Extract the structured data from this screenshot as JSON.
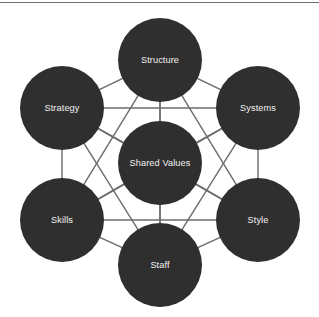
{
  "diagram": {
    "type": "network-graph",
    "canvas": {
      "width": 319,
      "height": 317,
      "background": "#ffffff"
    },
    "top_rule": {
      "visible": true,
      "color": "#6e6e6e",
      "y": 2,
      "thickness": 1
    },
    "style": {
      "node_fill": "#2f2f2f",
      "node_label_color": "#f2f2f2",
      "edge_color": "#6b6b6b",
      "edge_width": 1.4,
      "node_radius": 42,
      "center_node_radius": 42,
      "label_font_size": 9.2
    },
    "nodes": [
      {
        "id": "structure",
        "label": "Structure",
        "cx": 160,
        "cy": 60,
        "r": 42,
        "role": "hard-element"
      },
      {
        "id": "systems",
        "label": "Systems",
        "cx": 258,
        "cy": 108,
        "r": 42,
        "role": "hard-element"
      },
      {
        "id": "style",
        "label": "Style",
        "cx": 258,
        "cy": 220,
        "r": 42,
        "role": "soft-element"
      },
      {
        "id": "staff",
        "label": "Staff",
        "cx": 160,
        "cy": 265,
        "r": 42,
        "role": "soft-element"
      },
      {
        "id": "skills",
        "label": "Skills",
        "cx": 62,
        "cy": 220,
        "r": 42,
        "role": "soft-element"
      },
      {
        "id": "strategy",
        "label": "Strategy",
        "cx": 62,
        "cy": 108,
        "r": 42,
        "role": "hard-element"
      },
      {
        "id": "shared-values",
        "label": "Shared Values",
        "cx": 160,
        "cy": 163,
        "r": 42,
        "role": "center"
      }
    ],
    "edges": [
      {
        "from": "structure",
        "to": "systems"
      },
      {
        "from": "structure",
        "to": "style"
      },
      {
        "from": "structure",
        "to": "staff"
      },
      {
        "from": "structure",
        "to": "skills"
      },
      {
        "from": "structure",
        "to": "strategy"
      },
      {
        "from": "structure",
        "to": "shared-values"
      },
      {
        "from": "systems",
        "to": "style"
      },
      {
        "from": "systems",
        "to": "staff"
      },
      {
        "from": "systems",
        "to": "skills"
      },
      {
        "from": "systems",
        "to": "strategy"
      },
      {
        "from": "systems",
        "to": "shared-values"
      },
      {
        "from": "style",
        "to": "staff"
      },
      {
        "from": "style",
        "to": "skills"
      },
      {
        "from": "style",
        "to": "strategy"
      },
      {
        "from": "style",
        "to": "shared-values"
      },
      {
        "from": "staff",
        "to": "skills"
      },
      {
        "from": "staff",
        "to": "strategy"
      },
      {
        "from": "staff",
        "to": "shared-values"
      },
      {
        "from": "skills",
        "to": "strategy"
      },
      {
        "from": "skills",
        "to": "shared-values"
      },
      {
        "from": "strategy",
        "to": "shared-values"
      }
    ]
  }
}
